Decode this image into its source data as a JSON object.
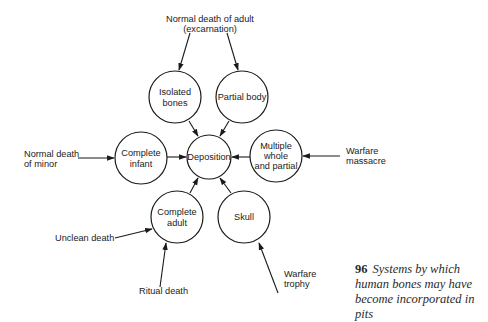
{
  "diagram": {
    "nodes": [
      {
        "id": "isolated",
        "lines": [
          "Isolated",
          "bones"
        ],
        "cx": 175,
        "cy": 97,
        "r": 26
      },
      {
        "id": "partial",
        "lines": [
          "Partial body"
        ],
        "cx": 242,
        "cy": 97,
        "r": 26
      },
      {
        "id": "deposition",
        "lines": [
          "Deposition"
        ],
        "cx": 209,
        "cy": 157,
        "r": 22
      },
      {
        "id": "infant",
        "lines": [
          "Complete",
          "infant"
        ],
        "cx": 141,
        "cy": 158,
        "r": 26
      },
      {
        "id": "multiple",
        "lines": [
          "Multiple",
          "whole",
          "and partial"
        ],
        "cx": 276,
        "cy": 156,
        "r": 26
      },
      {
        "id": "adult",
        "lines": [
          "Complete",
          "adult"
        ],
        "cx": 177,
        "cy": 217,
        "r": 26
      },
      {
        "id": "skull",
        "lines": [
          "Skull"
        ],
        "cx": 244,
        "cy": 217,
        "r": 26
      }
    ],
    "sources": [
      {
        "id": "normal-adult",
        "lines": [
          "Normal death of adult",
          "(excarnation)"
        ]
      },
      {
        "id": "normal-minor",
        "lines": [
          "Normal death",
          "of minor"
        ]
      },
      {
        "id": "warfare-massacre",
        "lines": [
          "Warfare",
          "massacre"
        ]
      },
      {
        "id": "unclean",
        "lines": [
          "Unclean death"
        ]
      },
      {
        "id": "ritual",
        "lines": [
          "Ritual death"
        ]
      },
      {
        "id": "warfare-trophy",
        "lines": [
          "Warfare",
          "trophy"
        ]
      }
    ]
  },
  "labels": {
    "isolated_1": "Isolated",
    "isolated_2": "bones",
    "partial_1": "Partial body",
    "deposition_1": "Deposition",
    "infant_1": "Complete",
    "infant_2": "infant",
    "multiple_1": "Multiple",
    "multiple_2": "whole",
    "multiple_3": "and partial",
    "adult_1": "Complete",
    "adult_2": "adult",
    "skull_1": "Skull",
    "src_adult_1": "Normal death of adult",
    "src_adult_2": "(excarnation)",
    "src_minor_1": "Normal death",
    "src_minor_2": "of minor",
    "src_massacre_1": "Warfare",
    "src_massacre_2": "massacre",
    "src_unclean_1": "Unclean death",
    "src_ritual_1": "Ritual death",
    "src_trophy_1": "Warfare",
    "src_trophy_2": "trophy"
  },
  "caption": {
    "number": "96",
    "text": "Systems by which human bones may have become incorporated in pits"
  }
}
